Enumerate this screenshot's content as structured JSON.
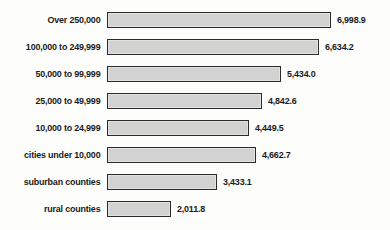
{
  "chart_data": {
    "type": "bar",
    "orientation": "horizontal",
    "title": "",
    "xlabel": "",
    "ylabel": "",
    "grid": false,
    "legend": false,
    "axis_visible": false,
    "xlim": [
      0,
      7000
    ],
    "categories": [
      "Over 250,000",
      "100,000 to 249,999",
      "50,000 to 99,999",
      "25,000 to 49,999",
      "10,000 to 24,999",
      "cities under 10,000",
      "suburban counties",
      "rural counties"
    ],
    "values": [
      6998.9,
      6634.2,
      5434.0,
      4842.6,
      4449.5,
      4662.7,
      3433.1,
      2011.8
    ],
    "value_labels": [
      "6,998.9",
      "6,634.2",
      "5,434.0",
      "4,842.6",
      "4,449.5",
      "4,662.7",
      "3,433.1",
      "2,011.8"
    ],
    "colors": {
      "bar_fill": "#d2d2d2",
      "bar_border": "#2b2b2b",
      "text": "#1a1a1a",
      "background": "#fdfdfb"
    }
  }
}
